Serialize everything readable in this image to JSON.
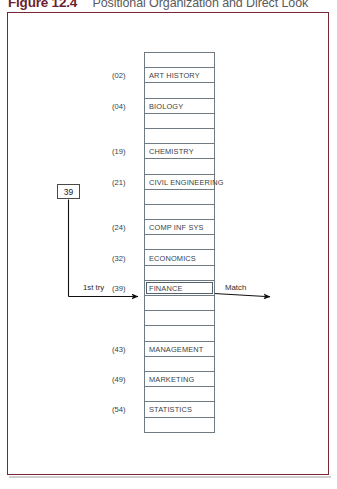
{
  "caption": {
    "number": "Figure 12.4",
    "text": "Positional Organization and Direct Look"
  },
  "colors": {
    "frame_border": "#7b2434",
    "table_border": "#6e7b82",
    "text": "#3a3f45",
    "caption_number": "#6b1f2e",
    "caption_text": "#5a5a5a"
  },
  "key": {
    "value": "39"
  },
  "annotations": {
    "first_try": "1st try",
    "match": "Match"
  },
  "table": {
    "rows": [
      {
        "index": "",
        "label": ""
      },
      {
        "index": "(02)",
        "label": "ART HISTORY"
      },
      {
        "index": "",
        "label": ""
      },
      {
        "index": "(04)",
        "label": "BIOLOGY"
      },
      {
        "index": "",
        "label": ""
      },
      {
        "index": "",
        "label": ""
      },
      {
        "index": "(19)",
        "label": "CHEMISTRY"
      },
      {
        "index": "",
        "label": ""
      },
      {
        "index": "(21)",
        "label": "CIVIL ENGINEERING"
      },
      {
        "index": "",
        "label": ""
      },
      {
        "index": "",
        "label": ""
      },
      {
        "index": "(24)",
        "label": "COMP INF SYS"
      },
      {
        "index": "",
        "label": ""
      },
      {
        "index": "(32)",
        "label": "ECONOMICS"
      },
      {
        "index": "",
        "label": ""
      },
      {
        "index": "(39)",
        "label": "FINANCE",
        "highlight": true
      },
      {
        "index": "",
        "label": ""
      },
      {
        "index": "",
        "label": ""
      },
      {
        "index": "",
        "label": ""
      },
      {
        "index": "(43)",
        "label": "MANAGEMENT"
      },
      {
        "index": "",
        "label": ""
      },
      {
        "index": "(49)",
        "label": "MARKETING"
      },
      {
        "index": "",
        "label": ""
      },
      {
        "index": "(54)",
        "label": "STATISTICS"
      },
      {
        "index": "",
        "label": ""
      }
    ]
  }
}
